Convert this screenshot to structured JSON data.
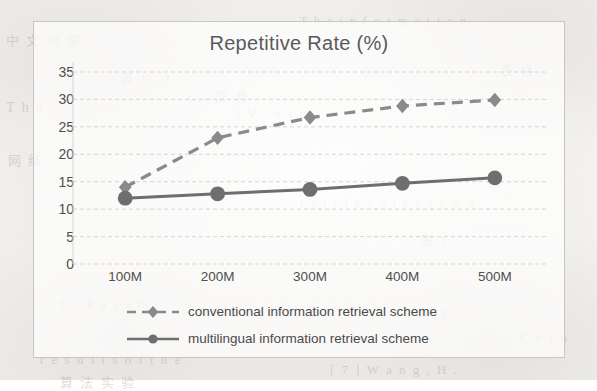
{
  "chart_data": {
    "type": "line",
    "title": "Repetitive Rate (%)",
    "xlabel": "",
    "ylabel": "",
    "categories": [
      "100M",
      "200M",
      "300M",
      "400M",
      "500M"
    ],
    "ylim": [
      0,
      35
    ],
    "yticks": [
      0,
      5,
      10,
      15,
      20,
      25,
      30,
      35
    ],
    "grid": true,
    "legend_position": "bottom",
    "series": [
      {
        "name": "conventional information retrieval scheme",
        "values": [
          14,
          23,
          26.7,
          28.8,
          29.9
        ],
        "style": "dashed",
        "marker": "diamond",
        "color": "#8a8a8a"
      },
      {
        "name": "multilingual information retrieval scheme",
        "values": [
          12,
          12.8,
          13.6,
          14.7,
          15.7
        ],
        "style": "solid",
        "marker": "circle",
        "color": "#6e6e6e"
      }
    ]
  },
  "legend": {
    "items": [
      {
        "label": "conventional information retrieval scheme"
      },
      {
        "label": "multilingual information retrieval scheme"
      }
    ]
  },
  "colors": {
    "series_dashed": "#8a8a8a",
    "series_solid": "#6e6e6e",
    "gridline": "#d8d5d0",
    "frame": "#c9c6c2",
    "text": "#4f4f4f",
    "title_text": "#5a5a5a"
  },
  "background_bleed": [
    {
      "text": "中 文 检 索",
      "x": 6,
      "y": 30,
      "size": 13
    },
    {
      "text": "T h e   i n f o r m a t i o n",
      "x": 300,
      "y": 14,
      "size": 12
    },
    {
      "text": "表  1 . 1",
      "x": 120,
      "y": 68,
      "size": 13
    },
    {
      "text": "C .     信 息",
      "x": 188,
      "y": 86,
      "size": 13
    },
    {
      "text": "I V .     S i m",
      "x": 236,
      "y": 106,
      "size": 13
    },
    {
      "text": "T h e",
      "x": 6,
      "y": 100,
      "size": 14
    },
    {
      "text": "网 络",
      "x": 8,
      "y": 150,
      "size": 13
    },
    {
      "text": "r e t r i e v a l   s c h e m e",
      "x": 300,
      "y": 196,
      "size": 12
    },
    {
      "text": "图  3",
      "x": 420,
      "y": 230,
      "size": 13
    },
    {
      "text": "C .     P a r a m",
      "x": 60,
      "y": 296,
      "size": 13
    },
    {
      "text": "[ 6 ]   L i   C .",
      "x": 380,
      "y": 306,
      "size": 13
    },
    {
      "text": "r e s u l t s   o f   t h e",
      "x": 40,
      "y": 352,
      "size": 13
    },
    {
      "text": "[ 7 ]   W a n g ,   H .",
      "x": 330,
      "y": 362,
      "size": 13
    },
    {
      "text": "算 法 实 验",
      "x": 60,
      "y": 372,
      "size": 13
    },
    {
      "text": "C h i n",
      "x": 520,
      "y": 330,
      "size": 13
    },
    {
      "text": "表 格",
      "x": 500,
      "y": 60,
      "size": 13
    }
  ]
}
